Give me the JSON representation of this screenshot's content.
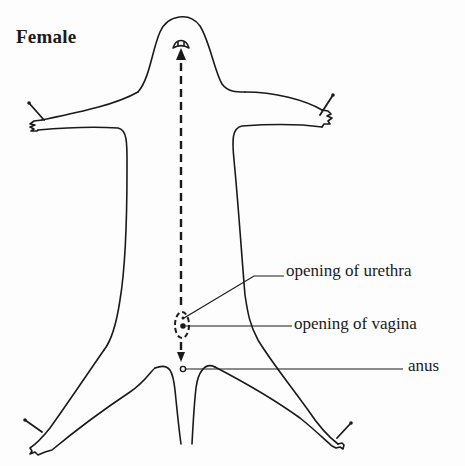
{
  "figure": {
    "title": "Female",
    "labels": {
      "urethra": "opening of urethra",
      "vagina": "opening of vagina",
      "anus": "anus"
    },
    "colors": {
      "ink": "#1a1a1a",
      "paper": "#fdfdfd"
    }
  }
}
